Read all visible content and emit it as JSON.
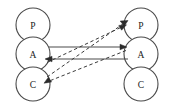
{
  "diagram": {
    "type": "node-link-graph",
    "background_color": "#ffffff",
    "stroke_color": "#4a4a4a",
    "label_color": "#1c1c1c",
    "columns": [
      {
        "name": "left-column",
        "nodes": [
          {
            "id": "left-p",
            "label": "P",
            "cx": 33,
            "cy": 25,
            "r": 17
          },
          {
            "id": "left-a",
            "label": "A",
            "cx": 33,
            "cy": 54,
            "r": 17
          },
          {
            "id": "left-c",
            "label": "C",
            "cx": 33,
            "cy": 84,
            "r": 17
          }
        ]
      },
      {
        "name": "right-column",
        "nodes": [
          {
            "id": "right-p",
            "label": "P",
            "cx": 141,
            "cy": 25,
            "r": 17
          },
          {
            "id": "right-a",
            "label": "A",
            "cx": 141,
            "cy": 54,
            "r": 17
          },
          {
            "id": "right-c",
            "label": "C",
            "cx": 141,
            "cy": 84,
            "r": 17
          }
        ]
      }
    ],
    "edges": [
      {
        "id": "edge-la-ra-top",
        "style": "solid",
        "from": "left-a",
        "to": "right-a",
        "x1": 49,
        "y1": 47,
        "x2": 126,
        "y2": 47,
        "arrow_at": "to"
      },
      {
        "id": "edge-ra-la-bottom",
        "style": "solid",
        "from": "right-a",
        "to": "left-a",
        "x1": 128,
        "y1": 59,
        "x2": 46,
        "y2": 59,
        "arrow_at": "to"
      },
      {
        "id": "edge-lc-rp-dashed",
        "style": "dashed",
        "from": "left-c",
        "to": "right-p",
        "x1": 47,
        "y1": 77,
        "x2": 127,
        "y2": 21,
        "arrow_at": "to"
      },
      {
        "id": "edge-la-rp-dashed",
        "style": "dashed",
        "from": "left-a",
        "to": "right-p",
        "x1": 48,
        "y1": 63,
        "x2": 126,
        "y2": 25,
        "arrow_at": "to"
      },
      {
        "id": "edge-ra-lc-dashed",
        "style": "dashed",
        "from": "right-a",
        "to": "left-c",
        "x1": 126,
        "y1": 50,
        "x2": 44,
        "y2": 83,
        "arrow_at": "to"
      }
    ]
  }
}
